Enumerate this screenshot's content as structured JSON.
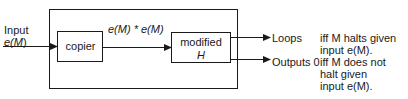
{
  "diagram": {
    "input_label_line1": "Input",
    "input_label_line2_prefix": "e(",
    "input_label_line2_var": "M",
    "input_label_line2_suffix": ")",
    "input_label": "Input e(M)",
    "copier_label": "copier",
    "edge_label": "e(M) * e(M)",
    "modified_label_line1": "modified",
    "modified_label_line2": "H",
    "outputs": [
      {
        "label": "Loops",
        "condition_line1": "iff M halts given",
        "condition_line2": "input e(M)."
      },
      {
        "label": "Outputs 0",
        "condition_line1": "iff M does not",
        "condition_line2": "halt given",
        "condition_line3": "input e(M)."
      }
    ],
    "line_color": "#1a1a1a"
  }
}
